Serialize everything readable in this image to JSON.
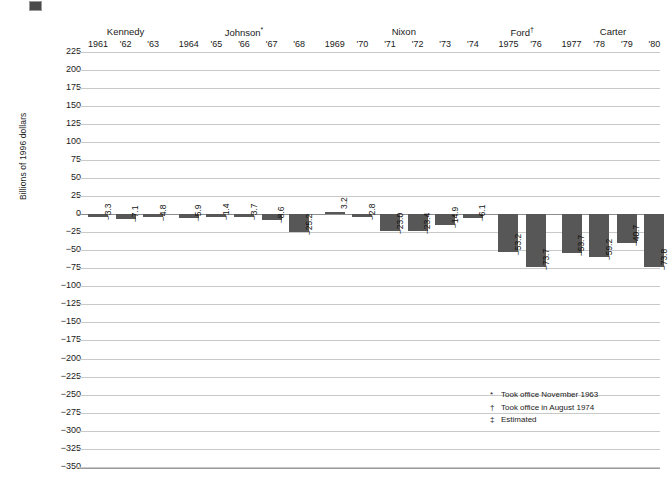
{
  "chart_data": {
    "type": "bar",
    "title": "",
    "xlabel": "",
    "ylabel": "Billions of 1996 dollars",
    "ylim": [
      -350,
      225
    ],
    "ytick_step": 25,
    "grid": true,
    "legend": "none",
    "categories": [
      "1961",
      "'62",
      "'63",
      "1964",
      "'65",
      "'66",
      "'67",
      "'68",
      "1969",
      "'70",
      "'71",
      "'72",
      "'73",
      "'74",
      "1975",
      "'76",
      "1977",
      "'78",
      "'79",
      "'80"
    ],
    "values": [
      -3.3,
      -7.1,
      -4.8,
      -5.9,
      -1.4,
      -3.7,
      -8.6,
      -25.2,
      3.2,
      -2.8,
      -23.0,
      -23.4,
      -14.9,
      -6.1,
      -53.2,
      -73.7,
      -53.7,
      -59.2,
      -40.7,
      -73.8
    ],
    "value_labels": [
      "−3.3",
      "−7.1",
      "−4.8",
      "−5.9",
      "−1.4",
      "−3.7",
      "−8.6",
      "−25.2",
      "3.2",
      "−2.8",
      "−23.0",
      "−23.4",
      "−14.9",
      "−6.1",
      "−53.2",
      "−73.7",
      "−53.7",
      "−59.2",
      "−40.7",
      "−73.8"
    ],
    "yticks": [
      "225",
      "200",
      "175",
      "150",
      "125",
      "100",
      "75",
      "50",
      "25",
      "0",
      "−25",
      "−50",
      "−75",
      "−100",
      "−125",
      "−150",
      "−175",
      "−200",
      "−225",
      "−250",
      "−275",
      "−300",
      "−325",
      "−350"
    ],
    "groups": [
      {
        "name": "Kennedy",
        "marker": "",
        "years": [
          "1961",
          "'62",
          "'63"
        ]
      },
      {
        "name": "Johnson",
        "marker": "*",
        "years": [
          "1964",
          "'65",
          "'66",
          "'67",
          "'68"
        ]
      },
      {
        "name": "Nixon",
        "marker": "",
        "years": [
          "1969",
          "'70",
          "'71",
          "'72",
          "'73",
          "'74"
        ]
      },
      {
        "name": "Ford",
        "marker": "†",
        "years": [
          "1975",
          "'76"
        ]
      },
      {
        "name": "Carter",
        "marker": "",
        "years": [
          "1977",
          "'78",
          "'79",
          "'80"
        ]
      }
    ],
    "bar_color": "#575757",
    "grid_color": "#c9c9c9"
  },
  "footnotes": [
    {
      "marker": "*",
      "text": "Took office November 1963"
    },
    {
      "marker": "†",
      "text": "Took office in August 1974"
    },
    {
      "marker": "‡",
      "text": "Estimated"
    }
  ]
}
